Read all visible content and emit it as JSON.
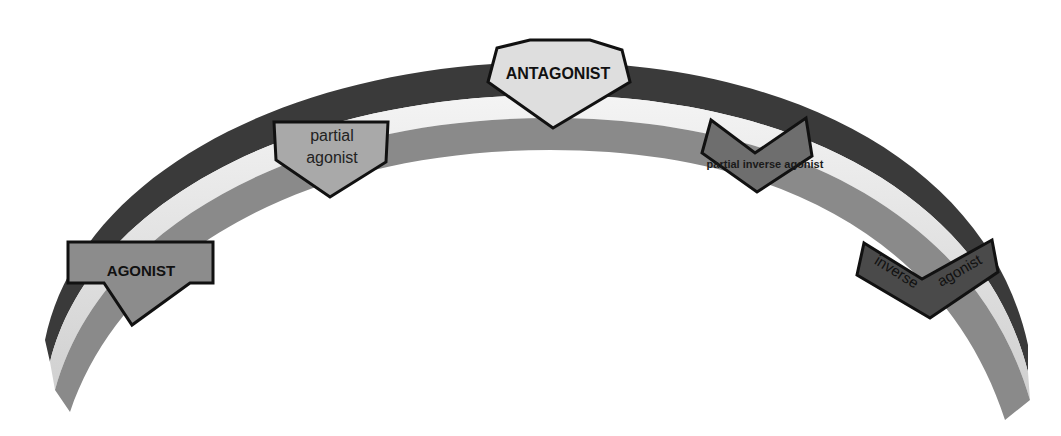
{
  "diagram": {
    "type": "receptor-activity-spectrum-arc",
    "colors": {
      "background": "#ffffff",
      "arc_outer_band": "#3a3a3a",
      "arc_middle_band": "#e6e6e6",
      "arc_inner_band": "#8a8a8a",
      "outline": "#111111",
      "text": "#111111"
    },
    "markers": [
      {
        "id": "agonist",
        "label": "AGONIST",
        "fill": "#8c8c8c",
        "font_weight": "bold",
        "shape": "pentagon-arrow-down"
      },
      {
        "id": "partial-agonist",
        "label_lines": [
          "partial",
          "agonist"
        ],
        "fill": "#a9a9a9",
        "font_weight": "normal",
        "shape": "pentagon-arrow-down"
      },
      {
        "id": "antagonist",
        "label": "ANTAGONIST",
        "fill": "#dedede",
        "font_weight": "bold",
        "shape": "hexagon-diamond"
      },
      {
        "id": "partial-inverse-agonist",
        "label": "partial inverse agonist",
        "fill": "#6e6e6e",
        "font_weight": "bold",
        "shape": "notched-chevron"
      },
      {
        "id": "inverse-agonist",
        "label_words": [
          "inverse",
          "agonist"
        ],
        "fill": "#4a4a4a",
        "font_weight": "normal",
        "shape": "notched-chevron-tilted"
      }
    ]
  }
}
